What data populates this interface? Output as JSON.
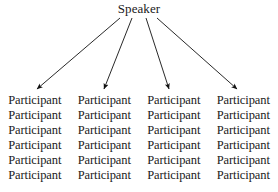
{
  "diagram": {
    "type": "one-to-many-broadcast",
    "root": {
      "label": "Speaker"
    },
    "columns": 4,
    "rows": 6,
    "leaf_label": "Participant",
    "leaves": [
      [
        "Participant",
        "Participant",
        "Participant",
        "Participant"
      ],
      [
        "Participant",
        "Participant",
        "Participant",
        "Participant"
      ],
      [
        "Participant",
        "Participant",
        "Participant",
        "Participant"
      ],
      [
        "Participant",
        "Participant",
        "Participant",
        "Participant"
      ],
      [
        "Participant",
        "Participant",
        "Participant",
        "Participant"
      ],
      [
        "Participant",
        "Participant",
        "Participant",
        "Participant"
      ]
    ],
    "arrows": [
      {
        "name": "arrow-to-column-1",
        "from_x": 120,
        "from_y": 18,
        "to_x": 37,
        "to_y": 89
      },
      {
        "name": "arrow-to-column-2",
        "from_x": 132,
        "from_y": 18,
        "to_x": 104,
        "to_y": 89
      },
      {
        "name": "arrow-to-column-3",
        "from_x": 146,
        "from_y": 18,
        "to_x": 169,
        "to_y": 89
      },
      {
        "name": "arrow-to-column-4",
        "from_x": 157,
        "from_y": 18,
        "to_x": 237,
        "to_y": 89
      }
    ],
    "colors": {
      "background": "#ffffff",
      "text": "#1a1a1a",
      "line": "#111111"
    }
  }
}
